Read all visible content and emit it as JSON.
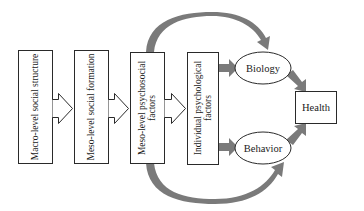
{
  "diagram": {
    "type": "flow",
    "stages": [
      {
        "id": "macro",
        "label": "Macro-level social structure"
      },
      {
        "id": "meso-formation",
        "label": "Meso-level social formation"
      },
      {
        "id": "meso-psychosocial",
        "label_line1": "Meso-level psychosocial",
        "label_line2": "factors"
      },
      {
        "id": "individual",
        "label_line1": "Individual psychological",
        "label_line2": "factors"
      }
    ],
    "mediators": [
      {
        "id": "biology",
        "label": "Biology"
      },
      {
        "id": "behavior",
        "label": "Behavior"
      }
    ],
    "outcome": {
      "id": "health",
      "label": "Health"
    },
    "edges": [
      {
        "from": "macro",
        "to": "meso-formation",
        "style": "hollow-arrow"
      },
      {
        "from": "meso-formation",
        "to": "meso-psychosocial",
        "style": "hollow-arrow"
      },
      {
        "from": "meso-psychosocial",
        "to": "individual",
        "style": "hollow-arrow"
      },
      {
        "from": "individual",
        "to": "biology",
        "style": "thick-gray-arrow"
      },
      {
        "from": "individual",
        "to": "behavior",
        "style": "thick-gray-arrow"
      },
      {
        "from": "meso-psychosocial",
        "to": "biology",
        "style": "curved-gray-arrow"
      },
      {
        "from": "meso-psychosocial",
        "to": "behavior",
        "style": "curved-gray-arrow"
      },
      {
        "from": "biology",
        "to": "health",
        "style": "thick-gray-arrow"
      },
      {
        "from": "behavior",
        "to": "health",
        "style": "thick-gray-arrow"
      }
    ],
    "colors": {
      "stroke": "#2a2a2a",
      "arrow_fill": "#7a7a7a",
      "background": "#ffffff"
    }
  }
}
